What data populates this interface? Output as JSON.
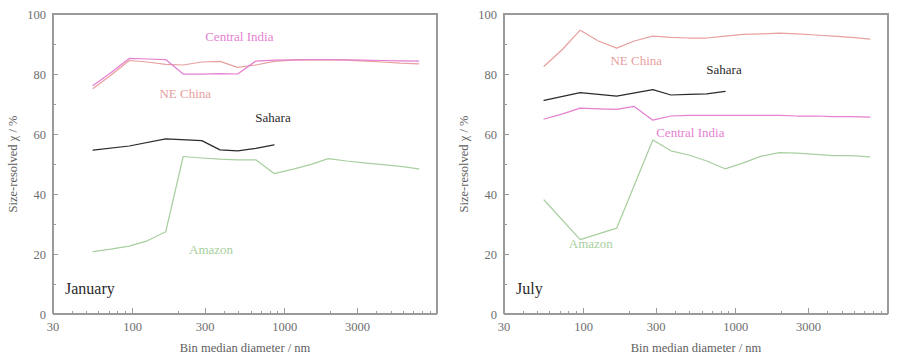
{
  "figure": {
    "panels": [
      {
        "id": "january",
        "label": "January",
        "xlabel": "Bin median diameter / nm",
        "ylabel": "Size-resolved χ / %"
      },
      {
        "id": "july",
        "label": "July",
        "xlabel": "Bin median diameter / nm",
        "ylabel": "Size-resolved χ / %"
      }
    ]
  },
  "chart_data": [
    {
      "type": "line",
      "title": "January",
      "xlabel": "Bin median diameter / nm",
      "ylabel": "Size-resolved χ / %",
      "xscale": "log",
      "xlim": [
        30,
        10000
      ],
      "ylim": [
        0,
        100
      ],
      "xticks": [
        30,
        100,
        300,
        1000,
        3000
      ],
      "xtick_labels": [
        "30",
        "100",
        "300",
        "1000",
        "3000"
      ],
      "yticks": [
        0,
        20,
        40,
        60,
        80,
        100
      ],
      "ytick_labels": [
        "0",
        "20",
        "40",
        "60",
        "80",
        "100"
      ],
      "grid": false,
      "legend": "inline-annotations",
      "series": [
        {
          "name": "NE China",
          "color": "#e8a0a0",
          "label_x": 150,
          "label_y": 72,
          "x": [
            55,
            72,
            95,
            125,
            165,
            215,
            285,
            375,
            490,
            645,
            850,
            1120,
            1470,
            1930,
            2540,
            3340,
            4390,
            5770,
            7590
          ],
          "y": [
            75.2,
            79.6,
            84.5,
            84.0,
            83.2,
            83.0,
            84.0,
            84.2,
            82.2,
            83.0,
            84.2,
            84.6,
            84.7,
            84.7,
            84.6,
            84.3,
            84.0,
            83.6,
            83.4
          ]
        },
        {
          "name": "Central India",
          "color": "#e57fd0",
          "label_x": 300,
          "label_y": 91,
          "x": [
            55,
            72,
            95,
            125,
            165,
            215,
            285,
            375,
            490,
            645,
            850,
            1120,
            1470,
            1930,
            2540,
            3340,
            4390,
            5770,
            7590
          ],
          "y": [
            76.2,
            80.4,
            85.2,
            85.0,
            84.8,
            80.0,
            80.0,
            80.1,
            80.0,
            84.3,
            84.6,
            84.7,
            84.8,
            84.8,
            84.7,
            84.6,
            84.5,
            84.4,
            84.3
          ]
        },
        {
          "name": "Sahara",
          "color": "#2b2b2b",
          "label_x": 640,
          "label_y": 64,
          "x": [
            55,
            95,
            165,
            285,
            375,
            490,
            645,
            850
          ],
          "y": [
            54.6,
            56.0,
            58.4,
            57.8,
            54.7,
            54.4,
            55.2,
            56.4
          ]
        },
        {
          "name": "Amazon",
          "color": "#a8cfa0",
          "label_x": 235,
          "label_y": 20,
          "x": [
            55,
            72,
            95,
            125,
            165,
            215,
            285,
            375,
            490,
            645,
            850,
            1120,
            1470,
            1930,
            2540,
            3340,
            4390,
            5770,
            7590
          ],
          "y": [
            20.8,
            21.6,
            22.6,
            24.4,
            27.4,
            52.5,
            52.0,
            51.6,
            51.4,
            51.4,
            46.8,
            48.2,
            49.8,
            51.8,
            51.0,
            50.4,
            49.8,
            49.2,
            48.4
          ]
        }
      ]
    },
    {
      "type": "line",
      "title": "July",
      "xlabel": "Bin median diameter / nm",
      "ylabel": "Size-resolved χ / %",
      "xscale": "log",
      "xlim": [
        30,
        10000
      ],
      "ylim": [
        0,
        100
      ],
      "xticks": [
        30,
        100,
        300,
        1000,
        3000
      ],
      "xtick_labels": [
        "30",
        "100",
        "300",
        "1000",
        "3000"
      ],
      "yticks": [
        0,
        20,
        40,
        60,
        80,
        100
      ],
      "ytick_labels": [
        "0",
        "20",
        "40",
        "60",
        "80",
        "100"
      ],
      "grid": false,
      "legend": "inline-annotations",
      "series": [
        {
          "name": "NE China",
          "color": "#e8a0a0",
          "label_x": 150,
          "label_y": 83,
          "x": [
            55,
            72,
            95,
            125,
            165,
            215,
            285,
            375,
            490,
            645,
            850,
            1120,
            1470,
            1930,
            2540,
            3340,
            4390,
            5770,
            7590
          ],
          "y": [
            82.6,
            88.0,
            94.6,
            91.0,
            88.6,
            91.0,
            92.6,
            92.2,
            92.0,
            92.0,
            92.6,
            93.2,
            93.4,
            93.6,
            93.4,
            93.0,
            92.6,
            92.2,
            91.6
          ]
        },
        {
          "name": "Sahara",
          "color": "#2b2b2b",
          "label_x": 640,
          "label_y": 80,
          "x": [
            55,
            95,
            165,
            285,
            375,
            490,
            645,
            850
          ],
          "y": [
            71.2,
            73.8,
            72.6,
            74.8,
            73.0,
            73.2,
            73.4,
            74.2
          ]
        },
        {
          "name": "Central India",
          "color": "#e57fd0",
          "label_x": 300,
          "label_y": 59,
          "x": [
            55,
            72,
            95,
            125,
            165,
            215,
            285,
            375,
            490,
            645,
            850,
            1120,
            1470,
            1930,
            2540,
            3340,
            4390,
            5770,
            7590
          ],
          "y": [
            65.0,
            66.6,
            68.6,
            68.4,
            68.2,
            69.2,
            64.6,
            66.0,
            66.2,
            66.2,
            66.2,
            66.2,
            66.2,
            66.2,
            66.0,
            66.0,
            65.8,
            65.8,
            65.6
          ]
        },
        {
          "name": "Amazon",
          "color": "#a8cfa0",
          "label_x": 80,
          "label_y": 22,
          "x": [
            55,
            95,
            165,
            285,
            375,
            490,
            645,
            850,
            1120,
            1470,
            1930,
            2540,
            3340,
            4390,
            5770,
            7590
          ],
          "y": [
            38.0,
            24.8,
            28.6,
            58.0,
            54.4,
            53.0,
            51.0,
            48.4,
            50.4,
            52.6,
            53.8,
            53.6,
            53.2,
            52.8,
            52.8,
            52.4
          ]
        }
      ]
    }
  ]
}
